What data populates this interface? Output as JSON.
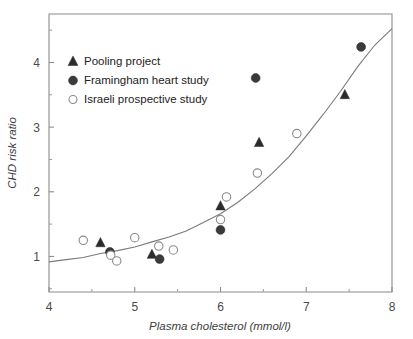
{
  "chart_data": {
    "type": "scatter",
    "title": "",
    "xlabel": "Plasma cholesterol (mmol/l)",
    "ylabel": "CHD risk ratio",
    "xlim": [
      4,
      8
    ],
    "ylim": [
      0.45,
      4.75
    ],
    "xticks": [
      "4",
      "5",
      "6",
      "7",
      "8"
    ],
    "xtick_values": [
      4,
      5,
      6,
      7,
      8
    ],
    "yticks": [
      "1",
      "2",
      "3",
      "4"
    ],
    "ytick_values": [
      1,
      2,
      3,
      4
    ],
    "x_minor_ticks": [
      4.5,
      5.5,
      6.5,
      7.5
    ],
    "y_minor_ticks": [
      0.5,
      1.5,
      2.5,
      3.5,
      4.5
    ],
    "grid": false,
    "legend_position": "top-left",
    "series": [
      {
        "name": "Pooling project",
        "marker": "filled-triangle",
        "color": "#2b2b2b",
        "points": [
          {
            "x": 4.6,
            "y": 1.21
          },
          {
            "x": 5.2,
            "y": 1.03
          },
          {
            "x": 6.0,
            "y": 1.78
          },
          {
            "x": 6.45,
            "y": 2.76
          },
          {
            "x": 7.45,
            "y": 3.5
          }
        ]
      },
      {
        "name": "Framingham heart study",
        "marker": "filled-circle",
        "color": "#3a3a3a",
        "points": [
          {
            "x": 4.71,
            "y": 1.07
          },
          {
            "x": 5.29,
            "y": 0.96
          },
          {
            "x": 6.0,
            "y": 1.41
          },
          {
            "x": 6.41,
            "y": 3.76
          },
          {
            "x": 7.64,
            "y": 4.24
          }
        ]
      },
      {
        "name": "Israeli prospective study",
        "marker": "open-circle",
        "color": "#8a8a8a",
        "points": [
          {
            "x": 4.4,
            "y": 1.25
          },
          {
            "x": 4.72,
            "y": 1.02
          },
          {
            "x": 4.79,
            "y": 0.93
          },
          {
            "x": 5.0,
            "y": 1.29
          },
          {
            "x": 5.28,
            "y": 1.16
          },
          {
            "x": 5.45,
            "y": 1.1
          },
          {
            "x": 6.0,
            "y": 1.57
          },
          {
            "x": 6.07,
            "y": 1.92
          },
          {
            "x": 6.43,
            "y": 2.29
          },
          {
            "x": 6.89,
            "y": 2.9
          }
        ]
      }
    ],
    "fit_curve": {
      "name": "fitted trend line",
      "points": [
        {
          "x": 4.0,
          "y": 0.91
        },
        {
          "x": 4.2,
          "y": 0.95
        },
        {
          "x": 4.4,
          "y": 0.99
        },
        {
          "x": 4.6,
          "y": 1.04
        },
        {
          "x": 4.8,
          "y": 1.09
        },
        {
          "x": 5.0,
          "y": 1.15
        },
        {
          "x": 5.2,
          "y": 1.22
        },
        {
          "x": 5.4,
          "y": 1.3
        },
        {
          "x": 5.6,
          "y": 1.4
        },
        {
          "x": 5.8,
          "y": 1.52
        },
        {
          "x": 6.0,
          "y": 1.66
        },
        {
          "x": 6.2,
          "y": 1.84
        },
        {
          "x": 6.4,
          "y": 2.04
        },
        {
          "x": 6.6,
          "y": 2.28
        },
        {
          "x": 6.8,
          "y": 2.55
        },
        {
          "x": 7.0,
          "y": 2.86
        },
        {
          "x": 7.2,
          "y": 3.2
        },
        {
          "x": 7.4,
          "y": 3.56
        },
        {
          "x": 7.6,
          "y": 3.93
        },
        {
          "x": 7.8,
          "y": 4.27
        },
        {
          "x": 8.0,
          "y": 4.53
        }
      ]
    }
  },
  "legend": {
    "items": [
      {
        "label": "Pooling project",
        "marker": "filled-triangle"
      },
      {
        "label": "Framingham heart study",
        "marker": "filled-circle"
      },
      {
        "label": "Israeli prospective study",
        "marker": "open-circle"
      }
    ]
  },
  "colors": {
    "axis": "#8c8c8c",
    "curve": "#7a7a7a",
    "filled_marker": "#3a3a3a",
    "triangle_marker": "#2b2b2b",
    "open_marker_stroke": "#8a8a8a",
    "text": "#222222",
    "background": "#ffffff"
  }
}
